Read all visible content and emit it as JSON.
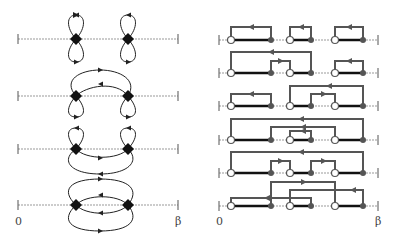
{
  "left_panel": {
    "axis_start_label": "0",
    "axis_end_label": "β",
    "axis_x": [
      18,
      178
    ],
    "vertex_x": [
      76,
      128
    ],
    "rows_y": [
      39,
      96,
      149,
      205
    ],
    "description": "Four diagrams with two diamond vertices on a dotted time axis, connected by directed loops/arcs"
  },
  "right_panel": {
    "axis_start_label": "0",
    "axis_end_label": "β",
    "axis_x": [
      219,
      378
    ],
    "open_points_x": [
      231,
      290,
      335
    ],
    "filled_points_x": [
      271,
      311,
      363
    ],
    "rows_y": [
      40,
      73,
      106,
      140,
      173,
      206
    ],
    "description": "Six rows of segment configurations with open and filled endpoints, connected by directed rectangular links"
  }
}
